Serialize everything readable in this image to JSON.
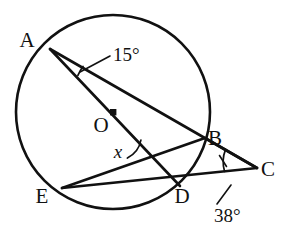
{
  "figure": {
    "background_color": "#ffffff",
    "stroke_color": "#111111"
  },
  "circle": {
    "center_label": "O",
    "center_x": 113,
    "center_y": 112,
    "radius": 97,
    "center_dot_radius": 3.2
  },
  "points": [
    {
      "label": "A",
      "x": 50,
      "y": 49,
      "label_x": 27,
      "label_y": 47,
      "on_circle": true
    },
    {
      "label": "B",
      "x": 205,
      "y": 138,
      "label_x": 209,
      "label_y": 138,
      "on_circle": true
    },
    {
      "label": "C",
      "x": 257,
      "y": 168,
      "label_x": 262,
      "label_y": 176,
      "on_circle": false
    },
    {
      "label": "D",
      "x": 180,
      "y": 186,
      "label_x": 173,
      "label_y": 203,
      "on_circle": true
    },
    {
      "label": "E",
      "x": 62,
      "y": 188,
      "label_x": 34,
      "label_y": 203,
      "on_circle": true
    },
    {
      "label": "O",
      "x": 113,
      "y": 112,
      "label_x": 93,
      "label_y": 132,
      "on_circle": false
    }
  ],
  "segments": [
    {
      "name": "A-to-C",
      "from": "A",
      "to": "C"
    },
    {
      "name": "A-to-D",
      "from": "A",
      "to": "D"
    },
    {
      "name": "E-to-B",
      "from": "E",
      "to": "B"
    },
    {
      "name": "E-to-C",
      "from": "E",
      "to": "C"
    },
    {
      "name": "B-to-C",
      "from": "B",
      "to": "C"
    }
  ],
  "angles": [
    {
      "name": "angle-at-A",
      "value": "15°",
      "vertex": "A",
      "label_x": 113,
      "label_y": 61,
      "leader_from_x": 110,
      "leader_from_y": 56,
      "leader_to_x": 80,
      "leader_to_y": 72,
      "arc_radius": 37
    },
    {
      "name": "angle-at-C",
      "value": "38°",
      "vertex": "C",
      "label_x": 214,
      "label_y": 219,
      "leader_from_x": 217,
      "leader_from_y": 204,
      "leader_to_x": 231,
      "leader_to_y": 185,
      "arc_radius": 33
    },
    {
      "name": "angle-x",
      "value": "x",
      "vertex": "intersection-of-AD-and-EB",
      "label_x": 118,
      "label_y": 155,
      "vertex_x": 152,
      "vertex_y": 163,
      "arc_radius": 25
    }
  ],
  "tick_marks": {
    "a_tick_present": true,
    "c_tick_present": true
  }
}
